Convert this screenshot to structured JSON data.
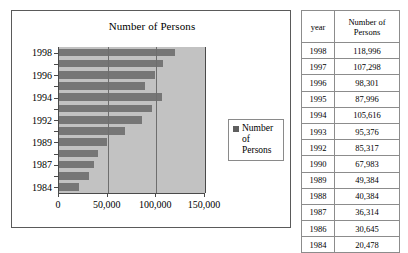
{
  "chart": {
    "title": "Number of Persons",
    "legend": {
      "label_line1": "Number of",
      "label_line2": "Persons"
    },
    "y_tick_labels": [
      "1998",
      "1996",
      "1994",
      "1992",
      "1989",
      "1987",
      "1984"
    ],
    "x_tick_labels": [
      "0",
      "50,000",
      "100,000",
      "150,000"
    ]
  },
  "table": {
    "headers": {
      "year": "year",
      "number_line1": "Number of",
      "number_line2": "Persons"
    },
    "rows": [
      {
        "year": "1998",
        "value": "118,996"
      },
      {
        "year": "1997",
        "value": "107,298"
      },
      {
        "year": "1996",
        "value": "98,301"
      },
      {
        "year": "1995",
        "value": "87,996"
      },
      {
        "year": "1994",
        "value": "105,616"
      },
      {
        "year": "1993",
        "value": "95,376"
      },
      {
        "year": "1992",
        "value": "85,317"
      },
      {
        "year": "1990",
        "value": "67,983"
      },
      {
        "year": "1989",
        "value": "49,384"
      },
      {
        "year": "1988",
        "value": "40,384"
      },
      {
        "year": "1987",
        "value": "36,314"
      },
      {
        "year": "1986",
        "value": "30,645"
      },
      {
        "year": "1984",
        "value": "20,478"
      }
    ]
  },
  "chart_data": {
    "type": "bar",
    "orientation": "horizontal",
    "title": "Number of Persons",
    "xlabel": "",
    "ylabel": "",
    "categories": [
      "1998",
      "1997",
      "1996",
      "1995",
      "1994",
      "1993",
      "1992",
      "1990",
      "1989",
      "1988",
      "1987",
      "1986",
      "1984"
    ],
    "values": [
      118996,
      107298,
      98301,
      87996,
      105616,
      95376,
      85317,
      67983,
      49384,
      40384,
      36314,
      30645,
      20478
    ],
    "series": [
      {
        "name": "Number of Persons",
        "values": [
          118996,
          107298,
          98301,
          87996,
          105616,
          95376,
          85317,
          67983,
          49384,
          40384,
          36314,
          30645,
          20478
        ]
      }
    ],
    "xlim": [
      0,
      150000
    ],
    "xticks": [
      0,
      50000,
      100000,
      150000
    ],
    "xtick_labels": [
      "0",
      "50,000",
      "100,000",
      "150,000"
    ],
    "ytick_labels": [
      "1998",
      "1996",
      "1994",
      "1992",
      "1989",
      "1987",
      "1984"
    ],
    "grid": true,
    "grid_axis": "x",
    "legend": "Number of Persons",
    "legend_position": "right",
    "bar_color": "#767676",
    "plot_background": "#c2c2c2"
  }
}
